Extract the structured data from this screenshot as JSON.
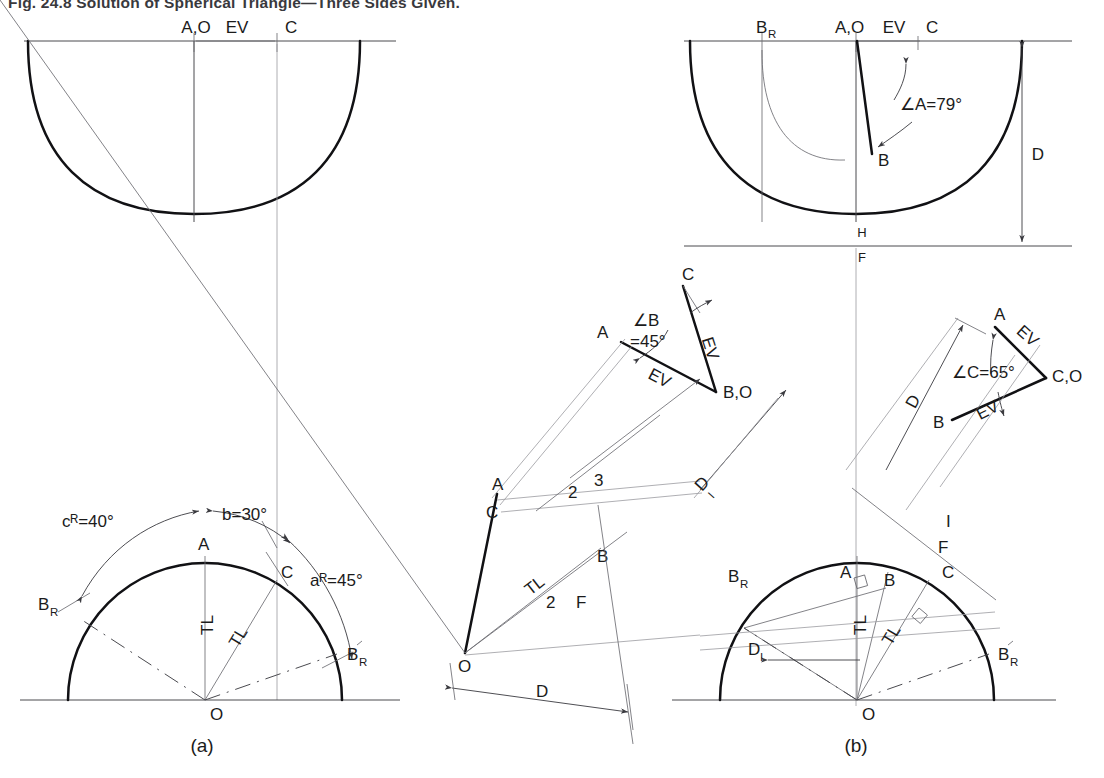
{
  "figure": {
    "title": "Fig. 24.8   Solution of Spherical Triangle—Three Sides Given.",
    "caption_a": "(a)",
    "caption_b": "(b)"
  },
  "view_a": {
    "top": {
      "label_AO": "A,O",
      "label_EV": "EV",
      "label_C": "C"
    },
    "bottom": {
      "angle_cR": "cᴿ=40°",
      "angle_b": "b=30°",
      "angle_aR": "aᴿ=45°",
      "point_A": "A",
      "point_C": "C",
      "point_BR": "B",
      "point_BR_sub": "R",
      "point_BRp": "B",
      "point_BRp_sub": "R",
      "point_O": "O",
      "tl_1": "TL",
      "tl_2": "TL"
    }
  },
  "view_b": {
    "top": {
      "label_BR": "B",
      "label_BR_sub": "R",
      "label_AO": "A,O",
      "label_EV": "EV",
      "label_C": "C",
      "angle_A": "∠A=79°",
      "point_B": "B",
      "fold_H": "H",
      "fold_F": "F",
      "dim_D": "D"
    },
    "tri_B": {
      "point_A": "A",
      "point_C": "C",
      "point_BO": "B,O",
      "angle_B_line1": "∠B",
      "angle_B_line2": "=45°",
      "ev_1": "EV",
      "ev_2": "EV"
    },
    "tri_C": {
      "point_A": "A",
      "point_B": "B",
      "point_CO": "C,O",
      "angle_C": "∠C=65°",
      "ev_1": "EV",
      "ev_2": "EV",
      "dim_D": "D"
    },
    "aux_left": {
      "point_A": "A",
      "point_C": "C",
      "point_B": "B",
      "point_O": "O",
      "tl": "TL",
      "fold_2": "2",
      "fold_3": "3",
      "dim_D1": "D",
      "dim_D1_sub": "I"
    },
    "fold_2F": {
      "num": "2",
      "letter": "F"
    },
    "fold_1F": {
      "num": "I",
      "letter": "F"
    },
    "bottom": {
      "point_A": "A",
      "point_B": "B",
      "point_C": "C",
      "point_BR": "B",
      "point_BR_sub": "R",
      "point_BRp": "B",
      "point_BRp_sub": "R",
      "point_O": "O",
      "tl_1": "TL",
      "tl_2": "TL",
      "dim_D1": "D",
      "dim_D1_sub": "I",
      "dim_D": "D"
    }
  },
  "colors": {
    "ink": "#1b1b1b",
    "line": "#4a4a4f",
    "heavy": "#111114",
    "light": "#9a9aa0",
    "background": "#ffffff"
  }
}
